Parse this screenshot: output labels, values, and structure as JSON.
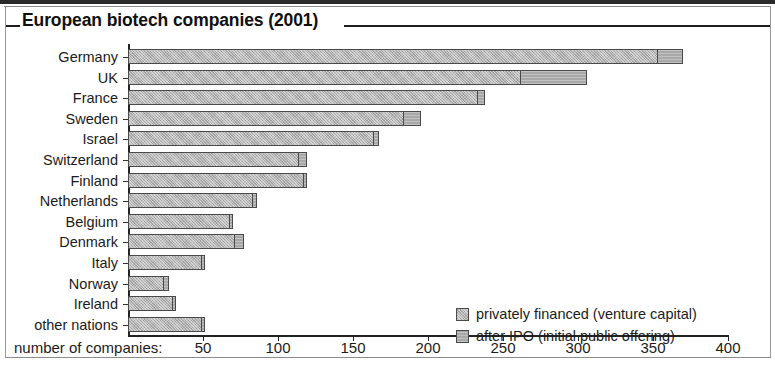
{
  "figure": {
    "title": "European biotech companies (2001)"
  },
  "chart_data": {
    "type": "bar",
    "orientation": "horizontal",
    "stacked": true,
    "title": "European biotech companies (2001)",
    "xlabel": "number of companies:",
    "ylabel": "",
    "xlim": [
      0,
      400
    ],
    "xticks": [
      50,
      100,
      150,
      200,
      250,
      300,
      350,
      400
    ],
    "xtick_labels": [
      "50",
      "100",
      "150",
      "200",
      "250",
      "300",
      "350",
      "400"
    ],
    "grid": false,
    "legend_position": "inside-right",
    "categories": [
      "Germany",
      "UK",
      "France",
      "Sweden",
      "Israel",
      "Switzerland",
      "Finland",
      "Netherlands",
      "Belgium",
      "Denmark",
      "Italy",
      "Norway",
      "Ireland",
      "other nations"
    ],
    "series": [
      {
        "name": "privately financed (venture capital)",
        "color": "#b4b4b4",
        "values": [
          353,
          262,
          233,
          184,
          164,
          114,
          117,
          83,
          68,
          71,
          49,
          24,
          30,
          49
        ]
      },
      {
        "name": "after IPO (initial public offering)",
        "color": "#a8a8a8",
        "values": [
          17,
          44,
          5,
          11,
          3,
          5,
          2,
          3,
          2,
          6,
          2,
          3,
          2,
          2
        ]
      }
    ],
    "totals": [
      370,
      306,
      238,
      195,
      167,
      119,
      119,
      86,
      70,
      77,
      51,
      27,
      32,
      51
    ]
  },
  "legend": {
    "items": [
      {
        "label": "privately financed (venture capital)",
        "swatch": "privately-financed"
      },
      {
        "label": "after IPO (initial public offering)",
        "swatch": "after-ipo"
      }
    ]
  },
  "colors": {
    "private_fill": "#b4b4b4",
    "ipo_fill": "#a8a8a8",
    "bar_border": "#4a4a4a",
    "axis": "#232323",
    "text": "#1b1b1b",
    "frame": "#8c8c8c"
  }
}
